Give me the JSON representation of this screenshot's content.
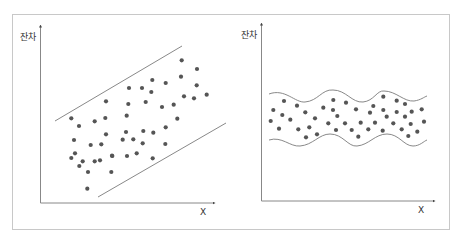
{
  "colors": {
    "frame": "#c8c8c8",
    "axis": "#666666",
    "band": "#7a7a7a",
    "dot": "#555555",
    "text": "#333333"
  },
  "chart_data": [
    {
      "type": "scatter",
      "title": "",
      "xlabel": "X",
      "ylabel": "잔차",
      "description": "Residuals spread within a linearly rising band (two parallel straight lines)",
      "band": {
        "shape": "linear",
        "upper": [
          [
            55,
            121
          ],
          [
            182,
            46
          ]
        ],
        "lower": [
          [
            98,
            197
          ],
          [
            226,
            123
          ]
        ]
      },
      "points": [
        [
          71.3,
          118.3
        ],
        [
          79,
          126
        ],
        [
          94.7,
          121.3
        ],
        [
          105.3,
          118
        ],
        [
          106,
          101.3
        ],
        [
          74,
          140
        ],
        [
          90.7,
          145
        ],
        [
          101.3,
          144.3
        ],
        [
          106,
          134.3
        ],
        [
          75,
          153.3
        ],
        [
          71.3,
          158
        ],
        [
          82.7,
          161.3
        ],
        [
          79.3,
          166
        ],
        [
          94.7,
          161.3
        ],
        [
          100,
          160.3
        ],
        [
          112,
          155.7
        ],
        [
          88,
          172
        ],
        [
          111.3,
          172
        ],
        [
          87.3,
          188.7
        ],
        [
          181.7,
          60.3
        ],
        [
          197,
          69
        ],
        [
          152.3,
          80
        ],
        [
          165.7,
          83
        ],
        [
          181,
          76.7
        ],
        [
          196.7,
          85.3
        ],
        [
          129,
          88
        ],
        [
          142,
          88
        ],
        [
          151.3,
          92
        ],
        [
          184,
          96.3
        ],
        [
          194,
          98.3
        ],
        [
          206.7,
          94.7
        ],
        [
          128.3,
          104
        ],
        [
          145.7,
          102
        ],
        [
          162,
          107
        ],
        [
          173.7,
          104.7
        ],
        [
          126.7,
          115.7
        ],
        [
          177.3,
          118.7
        ],
        [
          126,
          132
        ],
        [
          143.3,
          131
        ],
        [
          153.3,
          132.7
        ],
        [
          165.7,
          127.3
        ],
        [
          122.7,
          139.7
        ],
        [
          133.3,
          139.3
        ],
        [
          142.7,
          143.3
        ],
        [
          165.3,
          144
        ],
        [
          112.3,
          156
        ],
        [
          127,
          156
        ],
        [
          136.7,
          153.3
        ],
        [
          152.7,
          158.3
        ]
      ]
    },
    {
      "type": "scatter",
      "title": "",
      "xlabel": "X",
      "ylabel": "잔차",
      "description": "Residuals spread within a horizontal wavy band (two parallel wavy curves)",
      "band": {
        "shape": "wavy",
        "upper_path": "M269,94 C285,88 295,103 305,102 C318,101 322,89 333,90 C346,90 352,103 363,102 C374,101 377,90 384,91 C396,91 404,102 414,101 C421,100 424,97 427,96",
        "lower_path": "M269,140 C282,136 290,147 300,146 C313,145 319,134 330,134 C343,134 348,147 357,146 C369,145 375,134 387,134 C399,134 404,146 413,146 C420,146 424,141 427,140"
      },
      "points": [
        [
          284,
          101
        ],
        [
          297,
          105.7
        ],
        [
          273.3,
          110
        ],
        [
          282.3,
          115
        ],
        [
          305.3,
          112.3
        ],
        [
          323.3,
          107.7
        ],
        [
          270.7,
          121
        ],
        [
          290.3,
          119.7
        ],
        [
          315,
          118.3
        ],
        [
          279,
          128.7
        ],
        [
          298.3,
          129.3
        ],
        [
          309.3,
          127.3
        ],
        [
          328.3,
          123.3
        ],
        [
          306,
          137.3
        ],
        [
          317,
          134.3
        ],
        [
          333.3,
          100
        ],
        [
          333,
          110
        ],
        [
          346,
          102.7
        ],
        [
          383.3,
          96.7
        ],
        [
          396.7,
          100.7
        ],
        [
          405,
          104
        ],
        [
          356,
          109.3
        ],
        [
          370,
          112.7
        ],
        [
          373.3,
          106
        ],
        [
          383.3,
          110
        ],
        [
          396.7,
          112
        ],
        [
          411.7,
          111.7
        ],
        [
          421.7,
          109.3
        ],
        [
          337.3,
          116
        ],
        [
          386.7,
          116.7
        ],
        [
          405,
          116.7
        ],
        [
          345,
          123.3
        ],
        [
          360.7,
          122.7
        ],
        [
          375,
          122.7
        ],
        [
          393.3,
          123.3
        ],
        [
          410.7,
          124
        ],
        [
          424,
          121.7
        ],
        [
          336,
          130
        ],
        [
          351.7,
          130
        ],
        [
          368.3,
          129.3
        ],
        [
          382.7,
          130.7
        ],
        [
          401.7,
          129.3
        ],
        [
          417.3,
          131.7
        ],
        [
          358.3,
          136.7
        ],
        [
          408.3,
          136
        ]
      ]
    }
  ],
  "panels": {
    "left": {
      "ylabel": "잔차",
      "xlabel": "X"
    },
    "right": {
      "ylabel": "잔차",
      "xlabel": "X"
    }
  }
}
